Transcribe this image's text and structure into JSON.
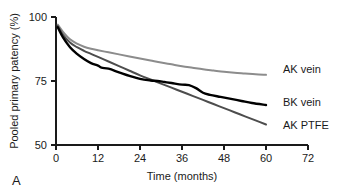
{
  "figure": {
    "panel_label": "A",
    "background_color": "#ffffff"
  },
  "chart_data": {
    "type": "line",
    "title": "",
    "subtitle": "",
    "xlabel": "Time (months)",
    "ylabel": "Pooled primary patency (%)",
    "xlim": [
      0,
      72
    ],
    "ylim": [
      50,
      100
    ],
    "xticks": [
      0,
      12,
      24,
      36,
      48,
      60,
      72
    ],
    "xticklabels": [
      "0",
      "12",
      "24",
      "36",
      "48",
      "60",
      "72"
    ],
    "yticks": [
      50,
      75,
      100
    ],
    "yticklabels": [
      "50",
      "75",
      "100"
    ],
    "grid": false,
    "legend_position": "right-of-axes-inline",
    "series": [
      {
        "name": "AK vein",
        "label": "AK vein",
        "color": "#8c8c8c",
        "linewidth": 2.0,
        "x": [
          0.5,
          2,
          4,
          6,
          8,
          10,
          12,
          15,
          18,
          21,
          24,
          27,
          30,
          33,
          36,
          39,
          42,
          45,
          48,
          51,
          54,
          57,
          60
        ],
        "values": [
          97.0,
          94.2,
          91.3,
          89.6,
          88.4,
          87.6,
          87.0,
          86.2,
          85.4,
          84.6,
          83.8,
          83.0,
          82.2,
          81.5,
          80.8,
          80.2,
          79.6,
          79.1,
          78.6,
          78.2,
          77.9,
          77.6,
          77.4
        ]
      },
      {
        "name": "AK PTFE",
        "label": "AK PTFE",
        "color": "#4d4d4d",
        "linewidth": 2.0,
        "x": [
          0.5,
          2,
          4,
          6,
          8,
          10,
          12,
          15,
          18,
          21,
          24,
          27,
          30,
          33,
          36,
          39,
          42,
          45,
          48,
          51,
          54,
          57,
          60
        ],
        "values": [
          96.5,
          93.0,
          90.0,
          88.2,
          86.8,
          85.6,
          84.4,
          82.6,
          80.8,
          79.0,
          77.2,
          75.6,
          74.0,
          72.4,
          70.8,
          69.2,
          67.6,
          66.0,
          64.4,
          62.8,
          61.2,
          59.6,
          58.0
        ]
      },
      {
        "name": "BK vein",
        "label": "BK vein",
        "color": "#000000",
        "linewidth": 2.4,
        "x": [
          0.5,
          2,
          4,
          6,
          8,
          10,
          12,
          13,
          15,
          18,
          21,
          24,
          27,
          29,
          31,
          33,
          36,
          38,
          40,
          42,
          44,
          47,
          50,
          53,
          56,
          60
        ],
        "values": [
          96.0,
          92.0,
          88.2,
          85.6,
          83.6,
          82.0,
          81.0,
          80.2,
          79.8,
          78.4,
          77.0,
          75.8,
          75.2,
          75.0,
          74.6,
          74.2,
          73.6,
          73.4,
          72.2,
          70.4,
          69.6,
          68.8,
          68.0,
          67.2,
          66.4,
          65.6
        ]
      }
    ],
    "series_label_positions": [
      {
        "name": "AK vein",
        "x_px": 283,
        "y_px": 73
      },
      {
        "name": "BK vein",
        "x_px": 283,
        "y_px": 106
      },
      {
        "name": "AK PTFE",
        "x_px": 283,
        "y_px": 129
      }
    ]
  }
}
